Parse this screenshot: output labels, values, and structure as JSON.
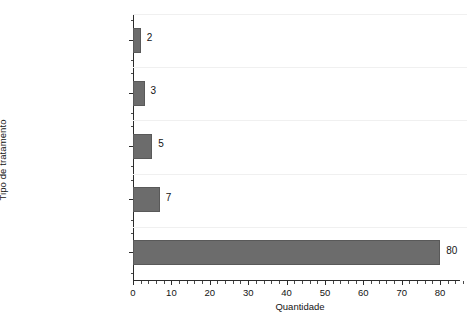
{
  "chart_data": {
    "type": "bar",
    "orientation": "horizontal",
    "title": "",
    "xlabel": "Quantidade",
    "ylabel": "Tipo de tratamento",
    "categories": [
      "Lodos Ativados com\nRemoção Biológica\nde Nutrientes -\nRem. N & P",
      "Lodos Ativados com\nRemoção Biológica\nde Nutrientes -\nRem. N",
      "Lodos Ativados com\nRemoção Físico\nQuímica de\nNutrientes - Rem. N\n& P",
      "Lodos Ativados -\nRem. N\n(MBBR/IFAS)",
      "Lodos Ativados em\nBatelada\n(Convencional/Unitank)\n- Rem. N"
    ],
    "values": [
      2,
      3,
      5,
      7,
      80
    ],
    "value_labels": [
      "2",
      "3",
      "5",
      "7",
      "80"
    ],
    "xlim": [
      0,
      87
    ],
    "xticks": [
      0,
      10,
      20,
      30,
      40,
      50,
      60,
      70,
      80
    ],
    "xtick_labels": [
      "0",
      "10",
      "20",
      "30",
      "40",
      "50",
      "60",
      "70",
      "80"
    ],
    "xtick_minor_step": 2,
    "grid": "horizontal-faint",
    "legend": "none",
    "bar_color": "#6c6c6c",
    "bar_edge_color": "#595959",
    "axis_color": "#2b2b2b",
    "background_color": "#ffffff"
  }
}
